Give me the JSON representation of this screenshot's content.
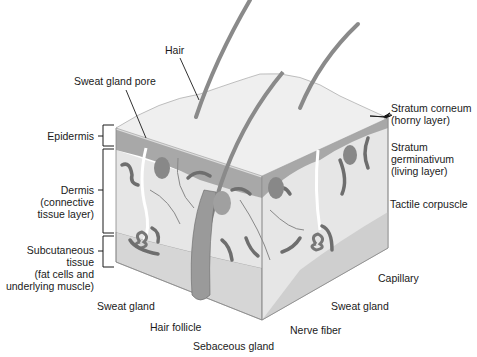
{
  "diagram": {
    "colors": {
      "surface": "#ececec",
      "epidermis": "#a9a9a9",
      "dermis": "#e3e3e3",
      "subcutaneous": "#d2d2d2",
      "structures": "#6e6e6e",
      "hair": "#8a8a8a",
      "lines": "#1a1a1a"
    },
    "labels": {
      "hair": "Hair",
      "sweat_gland_pore": "Sweat gland pore",
      "epidermis": "Epidermis",
      "dermis": [
        "Dermis",
        "(connective",
        "tissue layer)"
      ],
      "subcutaneous": [
        "Subcutaneous",
        "tissue",
        "(fat cells and",
        "underlying muscle)"
      ],
      "sweat_gland_left": "Sweat gland",
      "hair_follicle": "Hair follicle",
      "sebaceous_gland": "Sebaceous gland",
      "nerve_fiber": "Nerve fiber",
      "sweat_gland_right": "Sweat gland",
      "capillary": "Capillary",
      "tactile_corpuscle": "Tactile corpuscle",
      "stratum_germinativum": [
        "Stratum",
        "germinativum",
        "(living layer)"
      ],
      "stratum_corneum": [
        "Stratum corneum",
        "(horny layer)"
      ]
    }
  }
}
